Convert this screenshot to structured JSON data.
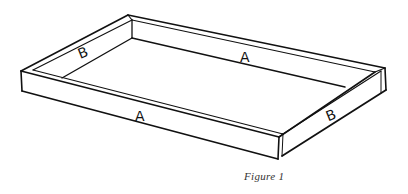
{
  "figure": {
    "caption": "Figure 1",
    "labels": {
      "back_long_side": "A",
      "front_long_side": "A",
      "left_short_side": "B",
      "right_short_side": "B"
    },
    "stroke_color": "#111111",
    "background": "#ffffff"
  }
}
